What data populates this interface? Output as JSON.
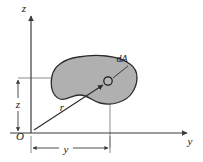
{
  "figure": {
    "background_color": "#ffffff",
    "line_color": "#3a3a3a",
    "stroke_color": "#2b2b2b",
    "area_fill_color": "#b0b0b0",
    "area_edge_color": "#2b2b2b",
    "text_color": "#1a1a1a"
  },
  "axes": {
    "vertical": {
      "name": "z-axis",
      "label": "z",
      "label_x": 24,
      "label_y": 12,
      "x": 31,
      "y_top": 15,
      "y_bottom": 133
    },
    "horizontal": {
      "name": "y-axis",
      "label": "y",
      "label_x": 190,
      "label_y": 145,
      "y": 133,
      "x_left": 10,
      "x_right": 188
    },
    "origin": {
      "label": "O",
      "label_x": 20,
      "label_y": 139,
      "x": 31,
      "y": 133
    }
  },
  "area": {
    "name": "area-region",
    "element_label": "dA",
    "element_label_x": 122,
    "element_label_y": 62,
    "point_x": 108,
    "point_y": 81,
    "point_radius": 4.2
  },
  "dimensions": [
    {
      "name": "z-dimension",
      "label": "z",
      "label_x": 14,
      "label_y": 107,
      "orientation": "vertical",
      "x": 18,
      "from": 78,
      "to": 133
    },
    {
      "name": "y-dimension",
      "label": "y",
      "label_x": 65,
      "label_y": 153,
      "orientation": "horizontal",
      "y": 148,
      "from": 31,
      "to": 110
    }
  ],
  "radial": {
    "name": "radius-vector",
    "label": "r",
    "label_x": 61,
    "label_y": 110,
    "from_x": 34,
    "from_y": 130,
    "to_x": 103,
    "to_y": 85
  },
  "projection_lines": [
    {
      "name": "z-level-line",
      "x1": 18,
      "y1": 78,
      "x2": 108,
      "y2": 78
    },
    {
      "name": "y-drop-line",
      "x1": 110,
      "y1": 81,
      "x2": 110,
      "y2": 148
    }
  ]
}
